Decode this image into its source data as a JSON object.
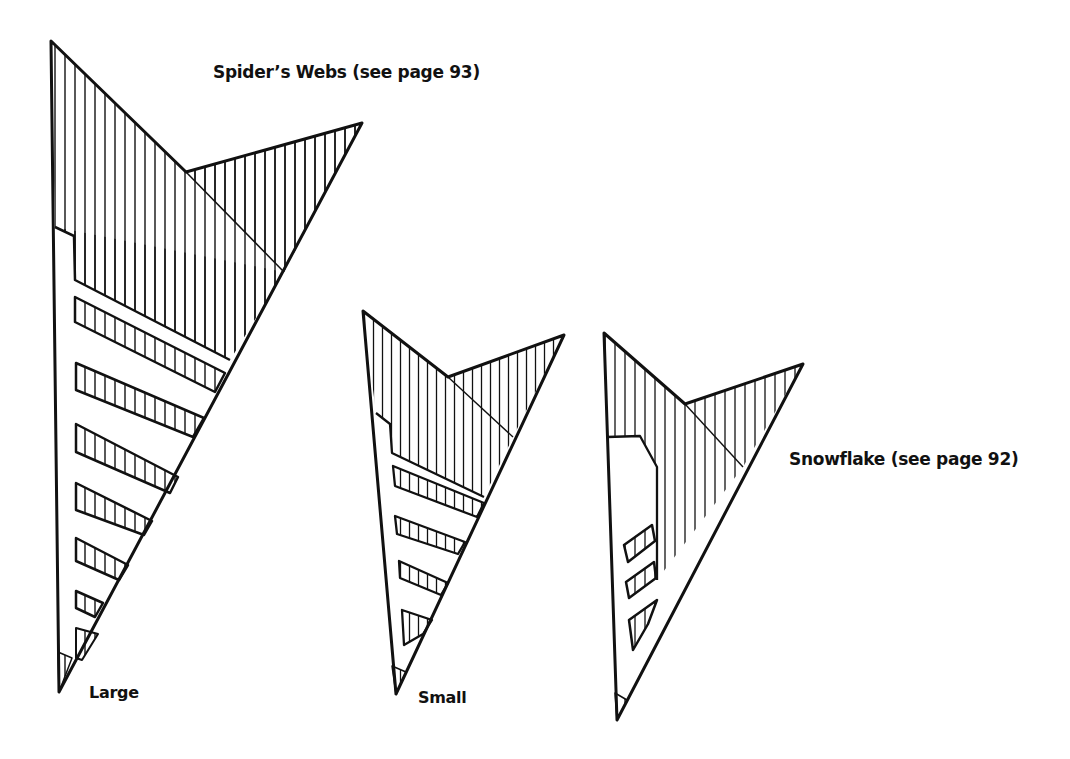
{
  "diagram": {
    "templates": [
      {
        "id": "spiders-web-large",
        "label": "Large",
        "group": "Spider's Webs"
      },
      {
        "id": "spiders-web-small",
        "label": "Small",
        "group": "Spider's Webs"
      },
      {
        "id": "snowflake",
        "label": "Snowflake (see page 92)",
        "group": "Snowflake"
      }
    ]
  },
  "labels": {
    "spiders_webs_title": "Spider’s Webs (see page 93)",
    "large": "Large",
    "small": "Small",
    "snowflake_title": "Snowflake (see page 92)"
  },
  "colors": {
    "ink": "#111111",
    "background": "#ffffff"
  }
}
